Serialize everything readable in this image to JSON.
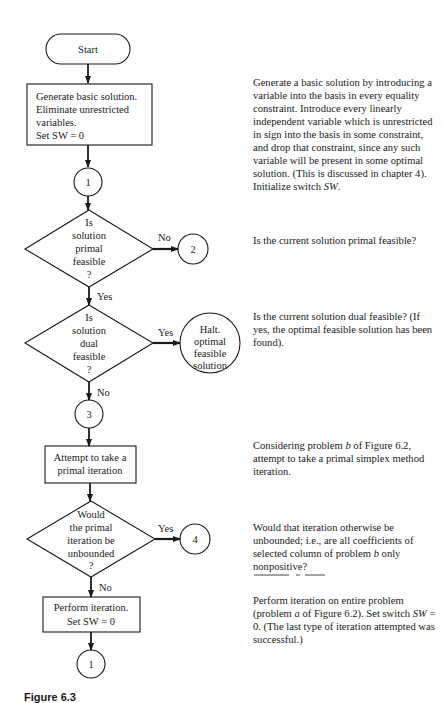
{
  "flowchart": {
    "start": {
      "label": "Start"
    },
    "generate_box": {
      "lines": [
        "Generate basic solution.",
        "Eliminate unrestricted",
        "variables.",
        "Set SW = 0"
      ]
    },
    "connector_1_top": {
      "label": "1"
    },
    "decision_primal": {
      "lines": [
        "Is",
        "solution",
        "primal",
        "feasible",
        "?"
      ],
      "no_label": "No",
      "yes_label": "Yes"
    },
    "connector_2": {
      "label": "2"
    },
    "decision_dual": {
      "lines": [
        "Is",
        "solution",
        "dual",
        "feasible",
        "?"
      ],
      "yes_label": "Yes",
      "no_label": "No"
    },
    "halt": {
      "lines": [
        "Halt.",
        "optimal",
        "feasible",
        "solution"
      ]
    },
    "connector_3": {
      "label": "3"
    },
    "attempt_box": {
      "lines": [
        "Attempt to take a",
        "primal iteration"
      ]
    },
    "decision_unbounded": {
      "lines": [
        "Would",
        "the primal",
        "iteration be",
        "unbounded",
        "?"
      ],
      "yes_label": "Yes",
      "no_label": "No"
    },
    "connector_4": {
      "label": "4"
    },
    "perform_box": {
      "lines": [
        "Perform iteration.",
        "Set SW = 0"
      ]
    },
    "connector_1_bottom": {
      "label": "1"
    }
  },
  "descriptions": {
    "generate": "Generate a basic solution by introducing a variable into the basis in every equality constraint. Introduce every linearly independent variable which is unrestricted in sign into the basis in some constraint, and drop that constraint, since any such variable will be present in some optimal solution. (This is discussed in chapter 4). Initialize switch",
    "generate_sw": "SW",
    "primal": "Is the current solution primal feasible?",
    "dual": "Is the current solution dual feasible? (If yes, the optimal feasible solution has been found).",
    "attempt_pre": "Considering problem",
    "attempt_b": "b",
    "attempt_post": "of Figure 6.2, attempt to take a primal simplex method iteration.",
    "unbounded_pre": "Would that iteration otherwise be unbounded; i.e., are all coefficients of selected column of problem",
    "unbounded_b": "b",
    "unbounded_post": "only nonpositive?",
    "perform_pre": "Perform iteration on entire problem (problem",
    "perform_a": "a",
    "perform_mid": "of Figure 6.2). Set switch",
    "perform_sw": "SW",
    "perform_post": "= 0. (The last type of iteration attempted was successful.)"
  },
  "caption": "Figure 6.3"
}
